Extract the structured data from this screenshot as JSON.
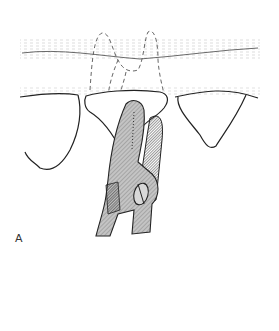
{
  "figure": {
    "panel_label": "A",
    "elements": [
      "gingiva-upper",
      "gingiva-lower",
      "left-tooth",
      "right-tooth",
      "target-tooth",
      "root-outline-dashed",
      "forceps"
    ],
    "colors": {
      "line": "#222222",
      "hatch": "#888888",
      "forceps_fill": "#b5b5b5",
      "forceps_dark": "#6a6a6a",
      "background": "#ffffff"
    }
  }
}
